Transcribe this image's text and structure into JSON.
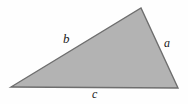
{
  "figure": {
    "type": "geometry-diagram",
    "shape": "triangle",
    "background_color": "#fefefe",
    "fill_color": "#b3b3b3",
    "stroke_color": "#6e6e6e",
    "stroke_width": 1.4,
    "label_color": "#1b1b1b",
    "vertices": [
      {
        "name": "left-vertex",
        "x": 11,
        "y": 87
      },
      {
        "name": "apex-vertex",
        "x": 141,
        "y": 8
      },
      {
        "name": "right-vertex",
        "x": 178,
        "y": 88
      }
    ],
    "polygon_points": "11,87 141,8 178,88",
    "sides": [
      {
        "id": "side-a",
        "label": "a",
        "label_x": 164,
        "label_y": 37,
        "font_size": 12,
        "from": "apex-vertex",
        "to": "right-vertex"
      },
      {
        "id": "side-b",
        "label": "b",
        "label_x": 63,
        "label_y": 32,
        "font_size": 13,
        "from": "left-vertex",
        "to": "apex-vertex"
      },
      {
        "id": "side-c",
        "label": "c",
        "label_x": 92,
        "label_y": 88,
        "font_size": 12,
        "from": "left-vertex",
        "to": "right-vertex"
      }
    ]
  }
}
